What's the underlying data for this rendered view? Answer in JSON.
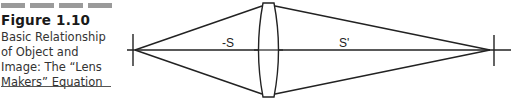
{
  "figure": {
    "number": "Figure 1.10",
    "title": "Basic Relationship of Object and Image: The “Lens Makers” Equation"
  },
  "diagram": {
    "object_distance_label": "-S",
    "image_distance_label": "S'",
    "elements": [
      "object-marker",
      "optical-axis",
      "converging-lens",
      "image-marker",
      "ray-lines"
    ]
  }
}
